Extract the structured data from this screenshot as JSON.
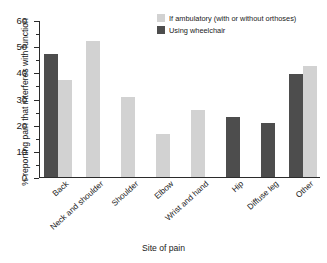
{
  "chart_data": {
    "type": "bar",
    "title": "",
    "xlabel": "Site of pain",
    "ylabel": "% reporting pain that interferes with function",
    "ylim": [
      0,
      60
    ],
    "ytick_step": 10,
    "yticks": [
      "0",
      "10",
      "20",
      "30",
      "40",
      "50",
      "60"
    ],
    "minor_tick_step": 5,
    "grid": false,
    "legend_position": "top-right",
    "categories": [
      "Back",
      "Neck and shoulder",
      "Shoulder",
      "Elbow",
      "Wrist and hand",
      "Hip",
      "Diffuse leg",
      "Other"
    ],
    "series": [
      {
        "name": "If ambulatory (with or without orthoses)",
        "color": "#d2d2d2",
        "values": [
          37,
          52,
          30.5,
          16.5,
          25.5,
          null,
          null,
          42.5
        ]
      },
      {
        "name": "Using wheelchair",
        "color": "#4d4d4d",
        "values": [
          47,
          null,
          null,
          null,
          null,
          23,
          20.5,
          39.5
        ]
      }
    ]
  },
  "legend": {
    "items": [
      {
        "label": "If ambulatory (with or without orthoses)",
        "color": "#d2d2d2"
      },
      {
        "label": "Using wheelchair",
        "color": "#4d4d4d"
      }
    ]
  },
  "axes": {
    "x_title": "Site of pain",
    "y_title": "% reporting pain that interferes with function"
  }
}
